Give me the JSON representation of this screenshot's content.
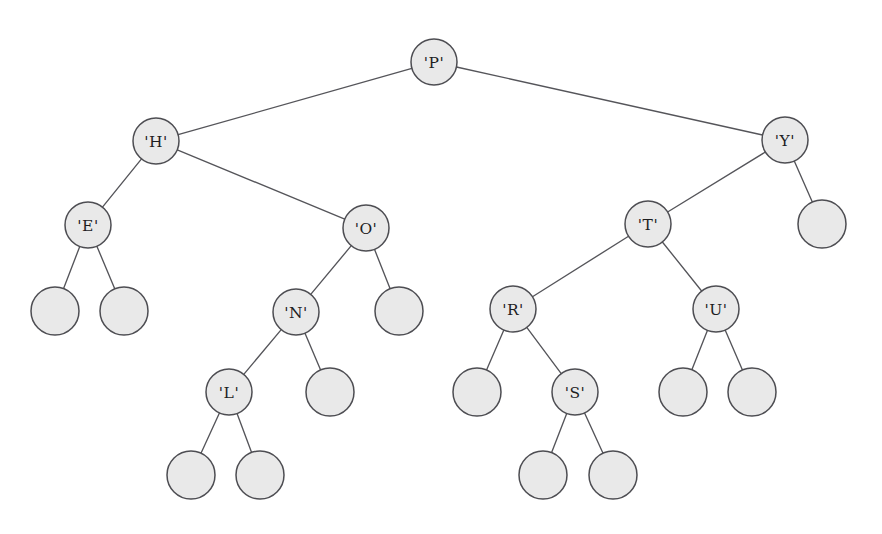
{
  "figure": {
    "name": "binary-search-tree-diagram",
    "type": "binary-tree",
    "background_color": "#ffffff",
    "node_fill_color": "#e9e9e9",
    "node_stroke_color": "#4d4d52",
    "edge_color": "#55555a",
    "label_color": "#1d1d1f",
    "node_radius": 23,
    "leaf_radius": 24,
    "width": 882,
    "height": 534
  },
  "chart_data": {
    "type": "tree",
    "title": "",
    "root": "P",
    "node_labels": [
      "'P'",
      "'H'",
      "'Y'",
      "'E'",
      "'O'",
      "'T'",
      "'N'",
      "'R'",
      "'U'",
      "'L'",
      "'S'"
    ],
    "internal_node_count": 11,
    "leaf_node_count": 12,
    "inorder_traversal": [
      "E",
      "H",
      "L",
      "N",
      "O",
      "P",
      "R",
      "S",
      "T",
      "U",
      "Y"
    ]
  },
  "nodes": [
    {
      "id": "P",
      "label": "'P'",
      "x": 434,
      "y": 62,
      "kind": "labeled",
      "depth": 0
    },
    {
      "id": "H",
      "label": "'H'",
      "x": 156,
      "y": 141,
      "kind": "labeled",
      "depth": 1
    },
    {
      "id": "Y",
      "label": "'Y'",
      "x": 785,
      "y": 140,
      "kind": "labeled",
      "depth": 1
    },
    {
      "id": "E",
      "label": "'E'",
      "x": 88,
      "y": 225,
      "kind": "labeled",
      "depth": 2
    },
    {
      "id": "O",
      "label": "'O'",
      "x": 366,
      "y": 228,
      "kind": "labeled",
      "depth": 2
    },
    {
      "id": "T",
      "label": "'T'",
      "x": 648,
      "y": 224,
      "kind": "labeled",
      "depth": 2
    },
    {
      "id": "N",
      "label": "'N'",
      "x": 296,
      "y": 312,
      "kind": "labeled",
      "depth": 3
    },
    {
      "id": "R",
      "label": "'R'",
      "x": 513,
      "y": 309,
      "kind": "labeled",
      "depth": 3
    },
    {
      "id": "U",
      "label": "'U'",
      "x": 716,
      "y": 309,
      "kind": "labeled",
      "depth": 3
    },
    {
      "id": "L",
      "label": "'L'",
      "x": 229,
      "y": 392,
      "kind": "labeled",
      "depth": 4
    },
    {
      "id": "S",
      "label": "'S'",
      "x": 575,
      "y": 392,
      "kind": "labeled",
      "depth": 4
    },
    {
      "id": "leaf-E-left",
      "label": "",
      "x": 55,
      "y": 311,
      "kind": "leaf",
      "depth": 3
    },
    {
      "id": "leaf-E-right",
      "label": "",
      "x": 124,
      "y": 311,
      "kind": "leaf",
      "depth": 3
    },
    {
      "id": "leaf-O-right",
      "label": "",
      "x": 399,
      "y": 311,
      "kind": "leaf",
      "depth": 3
    },
    {
      "id": "leaf-N-right",
      "label": "",
      "x": 330,
      "y": 392,
      "kind": "leaf",
      "depth": 4
    },
    {
      "id": "leaf-L-left",
      "label": "",
      "x": 191,
      "y": 475,
      "kind": "leaf",
      "depth": 5
    },
    {
      "id": "leaf-L-right",
      "label": "",
      "x": 260,
      "y": 475,
      "kind": "leaf",
      "depth": 5
    },
    {
      "id": "leaf-R-left",
      "label": "",
      "x": 477,
      "y": 392,
      "kind": "leaf",
      "depth": 4
    },
    {
      "id": "leaf-S-left",
      "label": "",
      "x": 543,
      "y": 475,
      "kind": "leaf",
      "depth": 5
    },
    {
      "id": "leaf-S-right",
      "label": "",
      "x": 613,
      "y": 475,
      "kind": "leaf",
      "depth": 5
    },
    {
      "id": "leaf-U-left",
      "label": "",
      "x": 683,
      "y": 392,
      "kind": "leaf",
      "depth": 4
    },
    {
      "id": "leaf-U-right",
      "label": "",
      "x": 752,
      "y": 392,
      "kind": "leaf",
      "depth": 4
    },
    {
      "id": "leaf-Y-right",
      "label": "",
      "x": 822,
      "y": 224,
      "kind": "leaf",
      "depth": 2
    }
  ],
  "edges": [
    {
      "from": "P",
      "to": "H",
      "side": "left"
    },
    {
      "from": "P",
      "to": "Y",
      "side": "right"
    },
    {
      "from": "H",
      "to": "E",
      "side": "left"
    },
    {
      "from": "H",
      "to": "O",
      "side": "right"
    },
    {
      "from": "E",
      "to": "leaf-E-left",
      "side": "left"
    },
    {
      "from": "E",
      "to": "leaf-E-right",
      "side": "right"
    },
    {
      "from": "O",
      "to": "N",
      "side": "left"
    },
    {
      "from": "O",
      "to": "leaf-O-right",
      "side": "right"
    },
    {
      "from": "N",
      "to": "L",
      "side": "left"
    },
    {
      "from": "N",
      "to": "leaf-N-right",
      "side": "right"
    },
    {
      "from": "L",
      "to": "leaf-L-left",
      "side": "left"
    },
    {
      "from": "L",
      "to": "leaf-L-right",
      "side": "right"
    },
    {
      "from": "Y",
      "to": "T",
      "side": "left"
    },
    {
      "from": "Y",
      "to": "leaf-Y-right",
      "side": "right"
    },
    {
      "from": "T",
      "to": "R",
      "side": "left"
    },
    {
      "from": "T",
      "to": "U",
      "side": "right"
    },
    {
      "from": "R",
      "to": "leaf-R-left",
      "side": "left"
    },
    {
      "from": "R",
      "to": "S",
      "side": "right"
    },
    {
      "from": "S",
      "to": "leaf-S-left",
      "side": "left"
    },
    {
      "from": "S",
      "to": "leaf-S-right",
      "side": "right"
    },
    {
      "from": "U",
      "to": "leaf-U-left",
      "side": "left"
    },
    {
      "from": "U",
      "to": "leaf-U-right",
      "side": "right"
    }
  ]
}
